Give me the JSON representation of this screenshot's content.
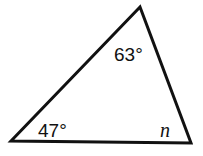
{
  "diagram": {
    "type": "triangle",
    "vertices": {
      "top": [
        140,
        7
      ],
      "bottom_left": [
        11,
        141
      ],
      "bottom_right": [
        191,
        143
      ]
    },
    "angles": {
      "top": "63°",
      "bottom_left": "47°",
      "bottom_right": "n"
    },
    "stroke_color": "#111111"
  }
}
